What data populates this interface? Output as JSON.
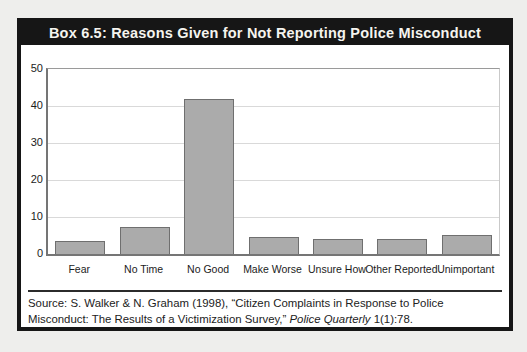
{
  "header": {
    "title": "Box 6.5: Reasons Given for Not Reporting Police Misconduct"
  },
  "chart_data": {
    "type": "bar",
    "title": "Box 6.5: Reasons Given for Not Reporting Police Misconduct",
    "categories": [
      "Fear",
      "No Time",
      "No Good",
      "Make Worse",
      "Unsure How",
      "Other Reported",
      "Unimportant"
    ],
    "values": [
      3.5,
      7.3,
      42,
      4.6,
      4,
      4,
      5.1
    ],
    "xlabel": "",
    "ylabel": "",
    "ylim": [
      0,
      50
    ],
    "yticks": [
      0,
      10,
      20,
      30,
      40,
      50
    ],
    "grid": true,
    "legend": "none",
    "bar_color": "#ababab",
    "bar_border_color": "#6f6f6f",
    "gridline_color": "#d9d9d9"
  },
  "source": {
    "prefix": "Source: S. Walker & N. Graham (1998), “Citizen Complaints in Response to Police Misconduct: The Results of a Victimization Survey,” ",
    "italic": "Police Quarterly",
    "suffix": " 1(1):78."
  }
}
